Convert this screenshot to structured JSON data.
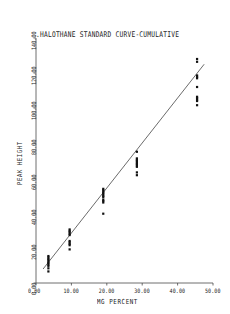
{
  "chart_data": {
    "type": "scatter",
    "title": ".HALOTHANE STANDARD CURVE-CUMULATIVE",
    "xlabel": "MG PERCENT",
    "ylabel": "PEAK HEIGHT",
    "xlim": [
      0,
      50
    ],
    "ylim": [
      0,
      140
    ],
    "xticks": [
      0,
      10,
      20,
      30,
      40,
      50
    ],
    "yticks": [
      0,
      20,
      40,
      60,
      80,
      100,
      120,
      140
    ],
    "xtick_labels": [
      "0.00",
      "10.00",
      "20.00",
      "30.00",
      "40.00",
      "50.00"
    ],
    "ytick_labels": [
      "0.00",
      "20.00",
      "40.00",
      "60.00",
      "80.00",
      "100.00",
      "120.00",
      "140.00"
    ],
    "grid": false,
    "legend": false,
    "marker": "square",
    "marker_color": "#111111",
    "line_color": "#3a3a3a",
    "series": [
      {
        "name": "Calibration points",
        "points": [
          [
            3.5,
            13.0
          ],
          [
            3.5,
            13.8
          ],
          [
            3.5,
            14.6
          ],
          [
            3.5,
            15.4
          ],
          [
            3.5,
            12.2
          ],
          [
            3.5,
            11.4
          ],
          [
            3.5,
            10.6
          ],
          [
            3.5,
            9.8
          ],
          [
            3.5,
            8.4
          ],
          [
            3.5,
            6.6
          ],
          [
            9.5,
            29.0
          ],
          [
            9.5,
            29.8
          ],
          [
            9.5,
            30.6
          ],
          [
            9.5,
            28.2
          ],
          [
            9.5,
            27.4
          ],
          [
            9.5,
            24.0
          ],
          [
            9.5,
            23.2
          ],
          [
            9.5,
            22.4
          ],
          [
            9.5,
            21.6
          ],
          [
            9.5,
            19.2
          ],
          [
            19.0,
            53.0
          ],
          [
            19.0,
            53.8
          ],
          [
            19.0,
            52.2
          ],
          [
            19.0,
            51.4
          ],
          [
            19.0,
            50.6
          ],
          [
            19.0,
            49.8
          ],
          [
            19.0,
            49.0
          ],
          [
            19.0,
            47.6
          ],
          [
            19.0,
            46.8
          ],
          [
            19.0,
            46.0
          ],
          [
            19.0,
            39.6
          ],
          [
            28.5,
            75.0
          ],
          [
            28.5,
            71.2
          ],
          [
            28.5,
            70.4
          ],
          [
            28.5,
            69.6
          ],
          [
            28.5,
            68.8
          ],
          [
            28.5,
            68.0
          ],
          [
            28.5,
            67.2
          ],
          [
            28.5,
            66.4
          ],
          [
            28.5,
            63.2
          ],
          [
            28.5,
            61.6
          ],
          [
            45.5,
            128.0
          ],
          [
            45.5,
            126.4
          ],
          [
            45.5,
            118.6
          ],
          [
            45.5,
            117.8
          ],
          [
            45.5,
            117.0
          ],
          [
            45.5,
            112.0
          ],
          [
            45.5,
            106.4
          ],
          [
            45.5,
            105.6
          ],
          [
            45.5,
            104.8
          ],
          [
            45.5,
            104.0
          ],
          [
            45.5,
            101.6
          ]
        ]
      }
    ],
    "fit_line": {
      "name": "Standard curve",
      "x_start": 2.0,
      "y_start": 8.0,
      "x_end": 47.5,
      "y_end": 125.0
    }
  }
}
